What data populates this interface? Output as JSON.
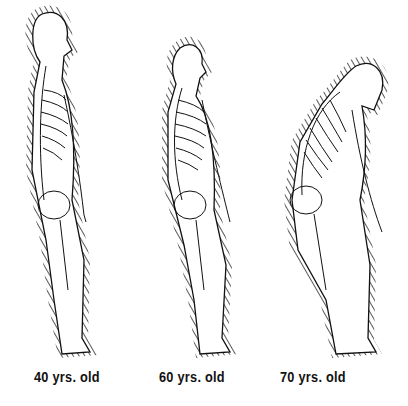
{
  "figures": [
    {
      "label": "40 yrs. old",
      "posture": "upright"
    },
    {
      "label": "60 yrs. old",
      "posture": "slight-curve"
    },
    {
      "label": "70 yrs. old",
      "posture": "stooped"
    }
  ],
  "colors": {
    "ink": "#111111",
    "background": "#ffffff"
  }
}
